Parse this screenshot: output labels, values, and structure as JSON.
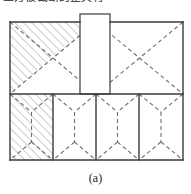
{
  "figure": {
    "caption": "(a)",
    "top_cropped_text": "上方被截断的正文行",
    "colors": {
      "outline": "#3a3a3a",
      "dashed_line": "#6e6e6e",
      "hatch": "#9a9a9a",
      "fill": "#ffffff",
      "caption_text": "#1c1c1c"
    },
    "geometry": {
      "frame": {
        "x": 10,
        "y": 22,
        "width": 173,
        "height": 138
      },
      "mid_divider_y": 94,
      "top_row": {
        "y": 22,
        "height": 72,
        "split_x": 96
      },
      "bottom_row": {
        "y": 94,
        "height": 66,
        "dividers_x": [
          53,
          96,
          139
        ]
      },
      "protrusion": {
        "x": 80,
        "y": 14,
        "width": 30,
        "height": 80
      }
    },
    "line_styles": {
      "outline": "solid",
      "internal": "dashed",
      "dash_pattern": "4 3"
    }
  },
  "top_row_cells": [
    {
      "id": "top-left-cell",
      "x": 10,
      "y": 22,
      "width": 86,
      "height": 72,
      "pattern": "x-cross",
      "hatched": true,
      "hatched_triangles": [
        "left",
        "top"
      ],
      "label": "Top left panel with cross bracing and hatched infill"
    },
    {
      "id": "top-right-cell",
      "x": 96,
      "y": 22,
      "width": 87,
      "height": 72,
      "pattern": "x-cross",
      "hatched": false,
      "hatched_triangles": [],
      "label": "Top right panel with cross bracing"
    }
  ],
  "bottom_row_cells": [
    {
      "id": "bottom-cell-1",
      "x": 10,
      "y": 94,
      "width": 43,
      "height": 66,
      "pattern": "bowtie-with-vertical",
      "hatched": true,
      "label": "Bottom panel 1 with hourglass bracing and hatched infill"
    },
    {
      "id": "bottom-cell-2",
      "x": 53,
      "y": 94,
      "width": 43,
      "height": 66,
      "pattern": "bowtie-with-vertical",
      "hatched": false,
      "label": "Bottom panel 2 with hourglass bracing"
    },
    {
      "id": "bottom-cell-3",
      "x": 96,
      "y": 94,
      "width": 43,
      "height": 66,
      "pattern": "bowtie-with-vertical",
      "hatched": false,
      "label": "Bottom panel 3 with hourglass bracing"
    },
    {
      "id": "bottom-cell-4",
      "x": 139,
      "y": 94,
      "width": 44,
      "height": 66,
      "pattern": "bowtie-with-vertical",
      "hatched": false,
      "label": "Bottom panel 4 with hourglass bracing"
    }
  ],
  "protrusion": {
    "id": "central-protrusion",
    "pattern": "plain",
    "hatched": false,
    "label": "Central tower block projecting above the roof line"
  }
}
